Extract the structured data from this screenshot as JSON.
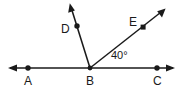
{
  "figure": {
    "type": "geometry-diagram",
    "background_color": "#ffffff",
    "stroke_color": "#1a1a1a",
    "labels": {
      "point_a": "A",
      "point_b": "B",
      "point_c": "C",
      "point_d": "D",
      "point_e": "E",
      "angle_ebc": "40°"
    },
    "points": {
      "a": {
        "x": 28,
        "y": 68
      },
      "b": {
        "x": 90,
        "y": 68
      },
      "c": {
        "x": 157,
        "y": 68
      },
      "d": {
        "x": 77,
        "y": 26
      },
      "e": {
        "x": 143,
        "y": 27
      }
    },
    "lines": {
      "line_ac": {
        "x1": 10,
        "y1": 68,
        "x2": 173,
        "y2": 68,
        "arrows": "both"
      },
      "ray_bd": {
        "x1": 90,
        "y1": 68,
        "x2": 70,
        "y2": 4,
        "arrows": "end"
      },
      "ray_be": {
        "x1": 90,
        "y1": 68,
        "x2": 165,
        "y2": 9,
        "arrows": "end"
      }
    }
  }
}
